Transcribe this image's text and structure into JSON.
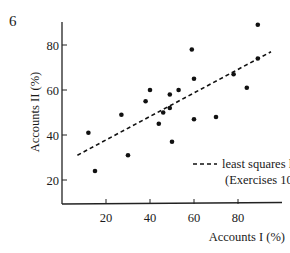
{
  "figure_number": "6",
  "chart_data": {
    "type": "scatter",
    "title": "",
    "xlabel": "Accounts I (%)",
    "ylabel": "Accounts II (%)",
    "xlim": [
      0,
      100
    ],
    "ylim": [
      11,
      95
    ],
    "grid": false,
    "x_ticks": [
      20,
      40,
      60,
      80
    ],
    "y_ticks": [
      20,
      40,
      60,
      80
    ],
    "x_tick_labels": [
      "20",
      "40",
      "60",
      "80"
    ],
    "y_tick_labels": [
      "20",
      "40",
      "60",
      "80"
    ],
    "series": [
      {
        "name": "observations",
        "marker": "filled-circle",
        "color": "#111111",
        "points": [
          [
            12,
            41
          ],
          [
            15,
            24
          ],
          [
            27,
            49
          ],
          [
            30,
            31
          ],
          [
            38,
            55
          ],
          [
            40,
            60
          ],
          [
            44,
            45
          ],
          [
            46,
            50
          ],
          [
            49,
            52
          ],
          [
            49,
            58
          ],
          [
            50,
            37
          ],
          [
            53,
            60
          ],
          [
            59,
            78
          ],
          [
            60,
            65
          ],
          [
            60,
            47
          ],
          [
            70,
            48
          ],
          [
            78,
            67
          ],
          [
            84,
            61
          ],
          [
            89,
            74
          ],
          [
            89,
            89
          ]
        ]
      },
      {
        "name": "least squares line",
        "style": "dashed",
        "color": "#111111",
        "points": [
          [
            7,
            31
          ],
          [
            95,
            77
          ]
        ]
      }
    ],
    "legend": {
      "position": "lower-right-inside",
      "entries": [
        {
          "symbol": "dashed-line",
          "label_line1": "least squares line",
          "label_line2": "(Exercises 10.4)"
        }
      ]
    }
  }
}
